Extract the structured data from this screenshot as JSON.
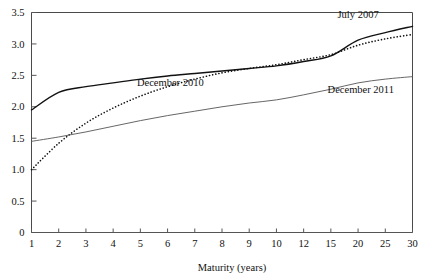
{
  "chart_data": {
    "type": "line",
    "title": "",
    "subtitle": "",
    "xlabel": "Maturity (years)",
    "ylabel": "",
    "x": [
      1,
      2,
      3,
      4,
      5,
      6,
      7,
      8,
      9,
      10,
      12,
      15,
      20,
      25,
      30
    ],
    "xtick_labels": [
      "1",
      "2",
      "3",
      "4",
      "5",
      "6",
      "7",
      "8",
      "9",
      "10",
      "12",
      "15",
      "20",
      "25",
      "30"
    ],
    "ytick_labels": [
      "0",
      "0.5",
      "1.0",
      "1.5",
      "2.0",
      "2.5",
      "3.0",
      "3.5"
    ],
    "yticks": [
      0,
      0.5,
      1.0,
      1.5,
      2.0,
      2.5,
      3.0,
      3.5
    ],
    "ylim": [
      0,
      3.5
    ],
    "xlim_index": [
      0,
      14
    ],
    "grid": false,
    "legend_position": "inline-annotations",
    "series": [
      {
        "name": "July 2007",
        "label": "July 2007",
        "style": "solid",
        "color": "#111111",
        "width": 1.4,
        "label_x": 20,
        "label_y": 3.42,
        "values": [
          1.95,
          2.23,
          2.32,
          2.38,
          2.44,
          2.49,
          2.53,
          2.57,
          2.61,
          2.65,
          2.72,
          2.81,
          3.06,
          3.18,
          3.28
        ]
      },
      {
        "name": "December 2010",
        "label": "December 2010",
        "style": "dotted",
        "color": "#111111",
        "width": 1.6,
        "label_x": 6.1,
        "label_y": 2.33,
        "values": [
          1.0,
          1.42,
          1.74,
          1.98,
          2.17,
          2.32,
          2.44,
          2.54,
          2.61,
          2.67,
          2.75,
          2.83,
          2.98,
          3.08,
          3.15
        ]
      },
      {
        "name": "December 2011",
        "label": "December 2011",
        "style": "solid",
        "color": "#555555",
        "width": 0.9,
        "label_x": 20.5,
        "label_y": 2.22,
        "values": [
          1.45,
          1.52,
          1.6,
          1.69,
          1.78,
          1.86,
          1.93,
          2.0,
          2.06,
          2.11,
          2.19,
          2.28,
          2.38,
          2.44,
          2.48
        ]
      }
    ],
    "annotations": [
      {
        "text": "July 2007",
        "x": 20,
        "y": 3.42
      },
      {
        "text": "December 2010",
        "x": 6.1,
        "y": 2.33
      },
      {
        "text": "December 2011",
        "x": 20.5,
        "y": 2.22
      }
    ]
  }
}
